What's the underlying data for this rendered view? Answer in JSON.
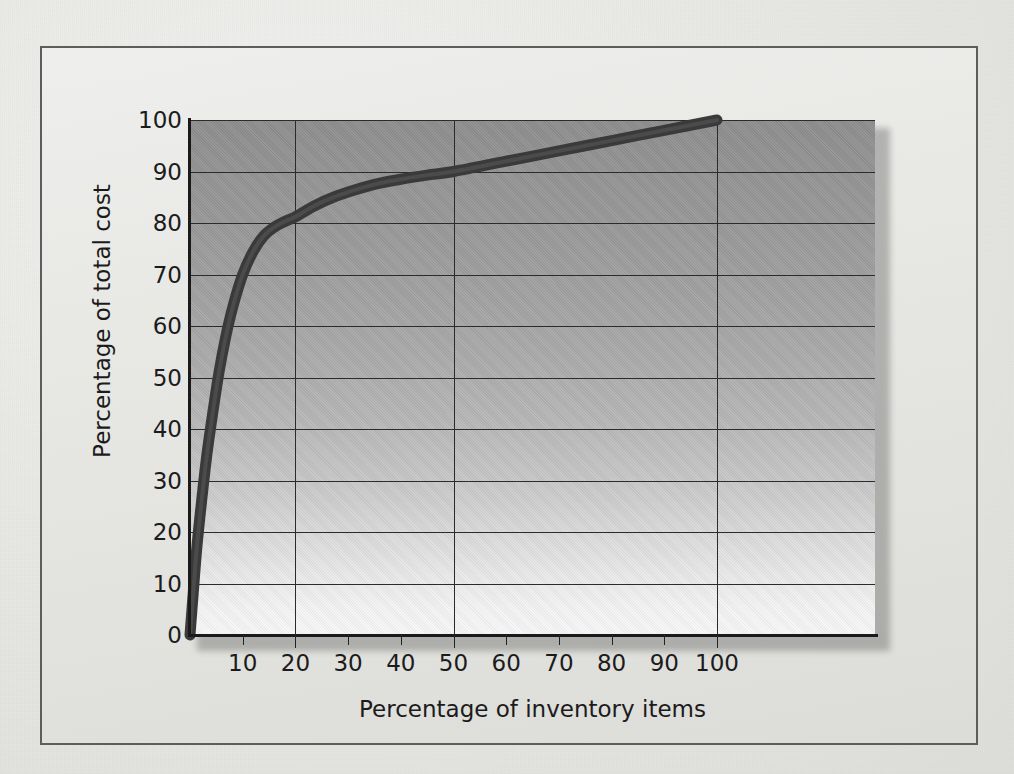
{
  "figure": {
    "kind": "pareto-curve-figure",
    "frame_border_color": "#5d5d5d",
    "page_background": "#e7e7e4"
  },
  "chart_data": {
    "type": "line",
    "title": "",
    "subtitle": "",
    "xlabel": "Percentage of inventory items",
    "ylabel": "Percentage of total cost",
    "xlim": [
      0,
      130
    ],
    "ylim": [
      0,
      100
    ],
    "x_ticks": [
      10,
      20,
      30,
      40,
      50,
      60,
      70,
      80,
      90,
      100
    ],
    "x_tick_labels": [
      "10",
      "20",
      "30",
      "40",
      "50",
      "60",
      "70",
      "80",
      "90",
      "100"
    ],
    "x_gridline_values": [
      20,
      50,
      100
    ],
    "y_ticks": [
      0,
      10,
      20,
      30,
      40,
      50,
      60,
      70,
      80,
      90,
      100
    ],
    "y_tick_labels": [
      "0",
      "10",
      "20",
      "30",
      "40",
      "50",
      "60",
      "70",
      "80",
      "90",
      "100"
    ],
    "y_gridline_values": [
      10,
      20,
      30,
      40,
      50,
      60,
      70,
      80,
      90,
      100
    ],
    "grid": true,
    "legend": null,
    "legend_position": "none",
    "annotations": [],
    "series": [
      {
        "name": "Cumulative percentage of total cost",
        "line_color": "#3a3a3a",
        "line_width_px": 11,
        "x": [
          0,
          0.6,
          1.3,
          2.2,
          3.2,
          4.3,
          5.5,
          6.8,
          8.2,
          10,
          12,
          14,
          16,
          18,
          20,
          23,
          26,
          30,
          35,
          40,
          45,
          50,
          60,
          70,
          80,
          90,
          100
        ],
        "y": [
          0,
          8,
          17,
          26,
          35,
          43,
          51,
          58,
          64,
          70,
          74.5,
          77.5,
          79.2,
          80.3,
          81.2,
          83.0,
          84.5,
          86.0,
          87.5,
          88.5,
          89.3,
          90.0,
          92.0,
          94.0,
          96.0,
          98.0,
          100
        ]
      }
    ]
  },
  "axis_titles": {
    "x": "Percentage of inventory items",
    "y": "Percentage of total cost"
  }
}
